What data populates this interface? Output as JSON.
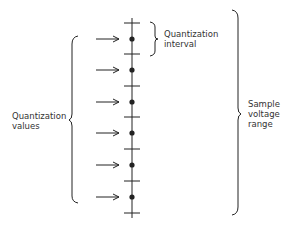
{
  "diagram": {
    "labels": {
      "quantization_interval": [
        "Quantization",
        "interval"
      ],
      "quantization_values": [
        "Quantization",
        "values"
      ],
      "sample_voltage_range": [
        "Sample",
        "voltage",
        "range"
      ]
    },
    "axis": {
      "x": 132,
      "top": 23,
      "bottom": 213
    },
    "ticks_y": [
      23,
      54,
      86,
      117,
      149,
      181,
      213
    ],
    "dots_y": [
      39,
      70,
      102,
      133,
      165,
      197
    ],
    "colors": {
      "ink": "#222222",
      "text": "#333333",
      "background": "#ffffff"
    }
  }
}
